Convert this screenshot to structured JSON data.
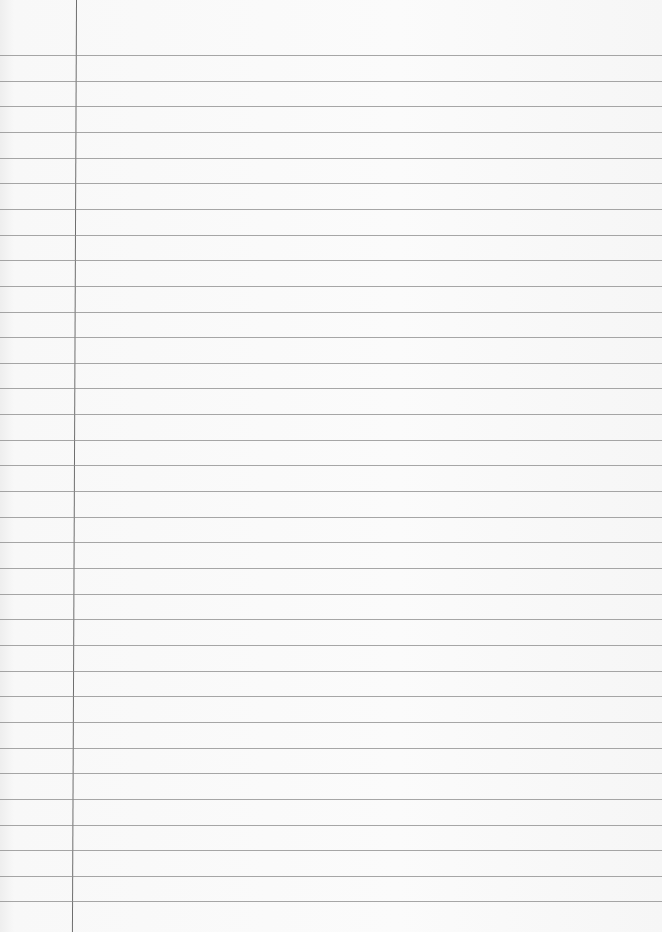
{
  "page": {
    "type": "lined-notebook-paper",
    "background_color": "#f8f8f8",
    "rule_color": "#8a8a8a",
    "margin_line_color": "#6e6e6e",
    "margin_line_x": 76,
    "first_rule_y": 55,
    "rule_spacing": 25.65,
    "rule_count": 34
  }
}
